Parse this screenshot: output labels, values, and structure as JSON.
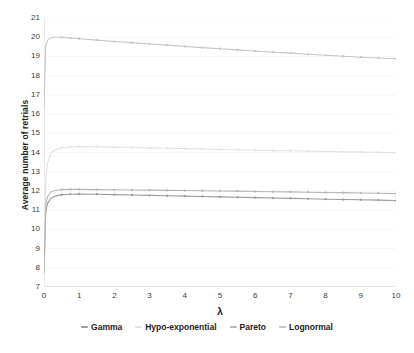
{
  "chart_data": {
    "type": "line",
    "title": "",
    "xlabel": "λ",
    "ylabel": "Average number of retrials",
    "xlim": [
      0,
      10
    ],
    "ylim": [
      7,
      21
    ],
    "xticks": [
      "0",
      "1",
      "2",
      "3",
      "4",
      "5",
      "6",
      "7",
      "8",
      "9",
      "10"
    ],
    "yticks": [
      "7",
      "8",
      "9",
      "10",
      "11",
      "12",
      "13",
      "14",
      "15",
      "16",
      "17",
      "18",
      "19",
      "20",
      "21"
    ],
    "grid": true,
    "legend_position": "bottom",
    "x": [
      0,
      0.05,
      0.1,
      0.2,
      0.3,
      0.4,
      0.5,
      0.75,
      1,
      1.5,
      2,
      2.5,
      3,
      3.5,
      4,
      4.5,
      5,
      5.5,
      6,
      6.5,
      7,
      7.5,
      8,
      8.5,
      9,
      9.5,
      10
    ],
    "series": [
      {
        "name": "Gamma",
        "color": "#9a9a9a",
        "values": [
          7.75,
          10.9,
          11.35,
          11.62,
          11.72,
          11.77,
          11.8,
          11.83,
          11.84,
          11.83,
          11.81,
          11.79,
          11.77,
          11.75,
          11.73,
          11.71,
          11.69,
          11.67,
          11.65,
          11.63,
          11.61,
          11.59,
          11.57,
          11.55,
          11.54,
          11.52,
          11.5
        ]
      },
      {
        "name": "Hypo-exponential",
        "color": "#e2e2e2",
        "values": [
          7.8,
          12.6,
          13.45,
          13.95,
          14.12,
          14.2,
          14.25,
          14.29,
          14.31,
          14.3,
          14.28,
          14.26,
          14.24,
          14.22,
          14.2,
          14.18,
          14.16,
          14.14,
          14.12,
          14.1,
          14.09,
          14.07,
          14.05,
          14.04,
          14.02,
          14.01,
          13.99
        ]
      },
      {
        "name": "Pareto",
        "color": "#b5b5b5",
        "values": [
          7.8,
          11.25,
          11.72,
          11.95,
          12.02,
          12.05,
          12.07,
          12.08,
          12.08,
          12.07,
          12.06,
          12.05,
          12.04,
          12.03,
          12.02,
          12.01,
          12.0,
          11.99,
          11.97,
          11.96,
          11.95,
          11.93,
          11.92,
          11.91,
          11.89,
          11.88,
          11.86
        ]
      },
      {
        "name": "Lognormal",
        "color": "#c6c6c6",
        "values": [
          16.3,
          19.55,
          19.85,
          19.97,
          20.0,
          20.0,
          19.99,
          19.96,
          19.92,
          19.85,
          19.78,
          19.72,
          19.65,
          19.59,
          19.52,
          19.46,
          19.4,
          19.34,
          19.28,
          19.22,
          19.17,
          19.11,
          19.06,
          19.01,
          18.96,
          18.92,
          18.88
        ]
      }
    ]
  },
  "legend": {
    "items": [
      {
        "label": "Gamma"
      },
      {
        "label": "Hypo-exponential"
      },
      {
        "label": "Pareto"
      },
      {
        "label": "Lognormal"
      }
    ]
  }
}
